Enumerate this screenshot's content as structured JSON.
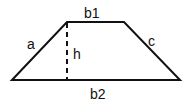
{
  "diagram": {
    "shape": "trapezoid",
    "colors": {
      "stroke": "#111111",
      "background": "#ffffff"
    },
    "vertices": {
      "bottom_left": [
        12,
        80
      ],
      "top_left": [
        67,
        22
      ],
      "top_right": [
        124,
        22
      ],
      "bottom_right": [
        180,
        80
      ]
    },
    "labels": {
      "top_base": "b1",
      "bottom_base": "b2",
      "left_side": "a",
      "right_side": "c",
      "height": "h"
    },
    "height_line": {
      "style": "dashed",
      "from": [
        67,
        22
      ],
      "to": [
        67,
        80
      ]
    }
  }
}
